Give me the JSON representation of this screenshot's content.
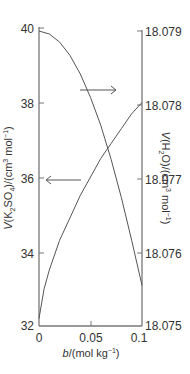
{
  "chart_data": {
    "type": "line",
    "title": "",
    "xlabel": "b/(mol kg⁻¹)",
    "ylabel_left": "V(K₂SO₄)/(cm³ mol⁻¹)",
    "ylabel_right": "V(H₂O)/(cm³ mol⁻¹)",
    "xlim": [
      0,
      0.1
    ],
    "ylim_left": [
      32,
      40
    ],
    "ylim_right": [
      18.075,
      18.079
    ],
    "x_ticks": [
      "0",
      "0.05",
      "0.1"
    ],
    "y_ticks_left": [
      "40",
      "38",
      "36",
      "34",
      "32"
    ],
    "y_ticks_right": [
      "18.079",
      "18.078",
      "18.077",
      "18.076",
      "18.075"
    ],
    "grid": false,
    "series": [
      {
        "name": "V(K2SO4)",
        "axis": "left",
        "x": [
          0,
          0.005,
          0.01,
          0.02,
          0.03,
          0.04,
          0.05,
          0.06,
          0.07,
          0.08,
          0.09,
          0.1
        ],
        "values": [
          32.2,
          33.0,
          33.5,
          34.3,
          34.9,
          35.5,
          36.0,
          36.5,
          36.9,
          37.3,
          37.7,
          38.0
        ]
      },
      {
        "name": "V(H2O)",
        "axis": "right",
        "x": [
          0,
          0.01,
          0.02,
          0.03,
          0.04,
          0.05,
          0.06,
          0.07,
          0.08,
          0.09,
          0.1
        ],
        "values": [
          18.079,
          18.07896,
          18.07885,
          18.07867,
          18.07842,
          18.0781,
          18.07772,
          18.07726,
          18.07674,
          18.07616,
          18.07555
        ]
      }
    ],
    "annotations": [
      {
        "type": "arrow",
        "direction": "right",
        "points_to": "right-axis",
        "curve": "V(H2O)"
      },
      {
        "type": "arrow",
        "direction": "left",
        "points_to": "left-axis",
        "curve": "V(K2SO4)"
      }
    ]
  }
}
